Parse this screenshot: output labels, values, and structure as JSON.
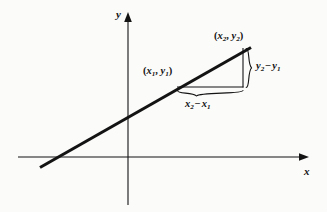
{
  "figure": {
    "background_color": "#fbfbfa",
    "ink_color": "#131313",
    "axes": {
      "x_axis_label": "x",
      "y_axis_label": "y",
      "origin": {
        "x": 128,
        "y": 157
      },
      "x_axis": {
        "x_start": 18,
        "x_end": 308,
        "y": 157,
        "arrow": "right"
      },
      "y_axis": {
        "y_start": 13,
        "y_end": 205,
        "x": 128,
        "arrow": "up"
      }
    },
    "line": {
      "name": "secant-line",
      "stroke_width": 3,
      "start": {
        "x": 40,
        "y": 167
      },
      "end": {
        "x": 251,
        "y": 48
      }
    },
    "triangle": {
      "horizontal_leg": {
        "x_start": 178,
        "x_end": 243,
        "y": 87
      },
      "vertical_leg": {
        "x": 243,
        "y_start": 48,
        "y_end": 87
      }
    },
    "labels": {
      "point1": {
        "open": "(",
        "var_x": "x",
        "sub_x": "1",
        "comma": ", ",
        "var_y": "y",
        "sub_y": "1",
        "close": ")",
        "text": "(x1, y1)"
      },
      "point2": {
        "open": "(",
        "var_x": "x",
        "sub_x": "2",
        "comma": ", ",
        "var_y": "y",
        "sub_y": "2",
        "close": ")",
        "text": "(x2, y2)"
      },
      "delta_y": {
        "var_a": "y",
        "sub_a": "2",
        "operator": "−",
        "var_b": "y",
        "sub_b": "1",
        "text": "y2 − y1"
      },
      "delta_x": {
        "var_a": "x",
        "sub_a": "2",
        "operator": "−",
        "var_b": "x",
        "sub_b": "1",
        "text": "x2 − x1"
      }
    },
    "braces": {
      "vertical_brace": {
        "x": 247,
        "y_top": 48,
        "y_bottom": 88,
        "orientation": "right"
      },
      "horizontal_brace": {
        "x_left": 178,
        "x_right": 243,
        "y": 92,
        "orientation": "down"
      }
    }
  }
}
